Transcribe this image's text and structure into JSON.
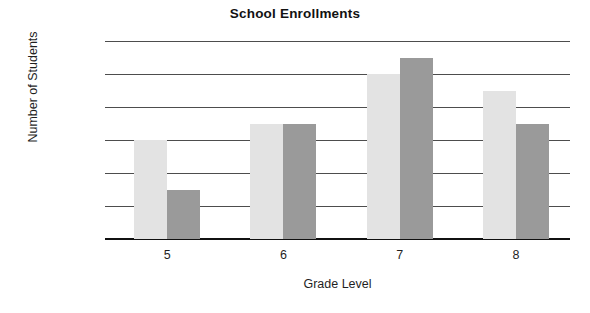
{
  "chart_data": {
    "type": "bar",
    "title": "School Enrollments",
    "xlabel": "Grade Level",
    "ylabel": "Number of Students",
    "categories": [
      "5",
      "6",
      "7",
      "8"
    ],
    "series": [
      {
        "name": "series-a",
        "color": "#e3e3e3",
        "values": [
          60,
          70,
          100,
          90
        ]
      },
      {
        "name": "series-b",
        "color": "#9a9a9a",
        "values": [
          30,
          70,
          110,
          70
        ]
      }
    ],
    "ylim": [
      0,
      120
    ],
    "yticks": [
      0,
      20,
      40,
      60,
      80,
      100,
      120
    ],
    "ytick_labels": [
      "0",
      "20",
      "40",
      "60",
      "80",
      "100",
      "120"
    ],
    "grid": true,
    "legend": "none"
  },
  "colors": {
    "series_a": "#e3e3e3",
    "series_b": "#9a9a9a",
    "gridline": "#4d4d4d",
    "axis": "#111111",
    "text": "#1f1f1f",
    "background": "#ffffff"
  }
}
